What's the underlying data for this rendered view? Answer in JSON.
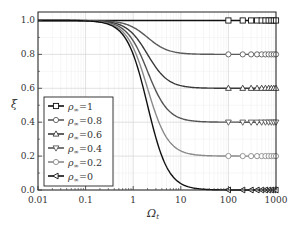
{
  "chart_data": {
    "type": "line",
    "title": "",
    "xlabel": "Ω_t",
    "ylabel": "ξ",
    "xscale": "log",
    "xlim": [
      0.01,
      1000
    ],
    "ylim": [
      0.0,
      1.05
    ],
    "grid": true,
    "legend_position": "lower left",
    "x_ticks": [
      "0.01",
      "0.1",
      "1",
      "10",
      "100",
      "1000"
    ],
    "y_ticks": [
      "0.0",
      "0.2",
      "0.4",
      "0.6",
      "0.8",
      "1.0"
    ],
    "x": [
      0.01,
      0.1,
      0.3,
      0.5,
      1,
      2,
      3,
      5,
      10,
      20,
      50,
      100,
      200,
      500,
      1000
    ],
    "series": [
      {
        "name": "ρ∞ = 1",
        "rho": 1.0,
        "marker": "square",
        "color": "#111111",
        "values": [
          1.0,
          1.0,
          1.0,
          1.0,
          1.0,
          1.0,
          1.0,
          1.0,
          1.0,
          1.0,
          1.0,
          1.0,
          1.0,
          1.0,
          1.0
        ]
      },
      {
        "name": "ρ∞ = 0.8",
        "rho": 0.8,
        "marker": "circle",
        "color": "#5a5a5a",
        "values": [
          1.0,
          1.0,
          0.996,
          0.988,
          0.96,
          0.9,
          0.862,
          0.827,
          0.808,
          0.802,
          0.8,
          0.8,
          0.8,
          0.8,
          0.8
        ]
      },
      {
        "name": "ρ∞ = 0.6",
        "rho": 0.6,
        "marker": "triangle-up",
        "color": "#3a3a3a",
        "values": [
          1.0,
          0.999,
          0.991,
          0.976,
          0.92,
          0.8,
          0.723,
          0.655,
          0.615,
          0.604,
          0.601,
          0.6,
          0.6,
          0.6,
          0.6
        ]
      },
      {
        "name": "ρ∞ = 0.4",
        "rho": 0.4,
        "marker": "triangle-down",
        "color": "#555555",
        "values": [
          1.0,
          0.999,
          0.987,
          0.965,
          0.88,
          0.7,
          0.585,
          0.482,
          0.423,
          0.406,
          0.401,
          0.4,
          0.4,
          0.4,
          0.4
        ]
      },
      {
        "name": "ρ∞ = 0.2",
        "rho": 0.2,
        "marker": "diamond",
        "color": "#8a8a8a",
        "values": [
          1.0,
          0.998,
          0.982,
          0.953,
          0.84,
          0.6,
          0.446,
          0.31,
          0.231,
          0.208,
          0.201,
          0.2,
          0.2,
          0.2,
          0.2
        ]
      },
      {
        "name": "ρ∞ = 0",
        "rho": 0.0,
        "marker": "triangle-left",
        "color": "#111111",
        "values": [
          1.0,
          0.998,
          0.978,
          0.941,
          0.8,
          0.5,
          0.308,
          0.138,
          0.038,
          0.01,
          0.002,
          0.0,
          0.0,
          0.0,
          0.0
        ]
      }
    ]
  },
  "legend": {
    "items": [
      {
        "label_sym": "ρ",
        "label_sub": "∞",
        "label_val": "=1"
      },
      {
        "label_sym": "ρ",
        "label_sub": "∞",
        "label_val": "=0.8"
      },
      {
        "label_sym": "ρ",
        "label_sub": "∞",
        "label_val": "=0.6"
      },
      {
        "label_sym": "ρ",
        "label_sub": "∞",
        "label_val": "=0.4"
      },
      {
        "label_sym": "ρ",
        "label_sub": "∞",
        "label_val": "=0.2"
      },
      {
        "label_sym": "ρ",
        "label_sub": "∞",
        "label_val": "=0"
      }
    ]
  },
  "axes": {
    "xlabel_main": "Ω",
    "xlabel_sub": "t",
    "ylabel": "ξ"
  }
}
